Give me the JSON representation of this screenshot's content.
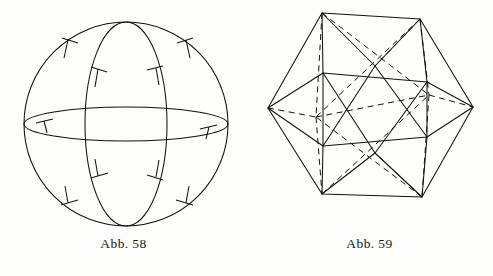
{
  "page": {
    "background_color": "#fdfdfb",
    "ink_color": "#111111",
    "width": 493,
    "height": 276
  },
  "figures": [
    {
      "id": "sphere",
      "caption": "Abb. 58",
      "kind": "line-drawing",
      "subject": "sphere-with-great-circles",
      "description": "Sphere outline with a vertical meridian ellipse and a horizontal equator ellipse, marked with right-angle tick symbols",
      "geometry": {
        "outline_circle": {
          "cx": 126,
          "cy": 124,
          "r": 102
        },
        "meridian_ellipse": {
          "cx": 126,
          "cy": 124,
          "rx": 41,
          "ry": 102
        },
        "equator_ellipse": {
          "cx": 126,
          "cy": 124,
          "rx": 102,
          "ry": 17
        },
        "right_angle_ticks": 8
      }
    },
    {
      "id": "icosahedron",
      "caption": "Abb. 59",
      "kind": "line-drawing",
      "subject": "icosahedron-wireframe",
      "description": "Icosahedron drawn in wireframe with solid visible edges and dashed hidden edges",
      "geometry": {
        "outer_hexagon_vertices": [
          [
            76,
            13
          ],
          [
            174,
            19
          ],
          [
            227,
            107
          ],
          [
            176,
            197
          ],
          [
            76,
            194
          ],
          [
            22,
            108
          ]
        ],
        "inner_upper_triangle": [
          [
            77,
            73
          ],
          [
            181,
            82
          ],
          [
            129,
            153
          ]
        ],
        "inner_lower_triangle": [
          [
            77,
            146
          ],
          [
            181,
            137
          ],
          [
            129,
            66
          ]
        ],
        "hidden_edge_count": 12,
        "visible_edge_count": 18
      }
    }
  ],
  "colors": {
    "ink": "#111111",
    "paper": "#fdfdfb"
  }
}
